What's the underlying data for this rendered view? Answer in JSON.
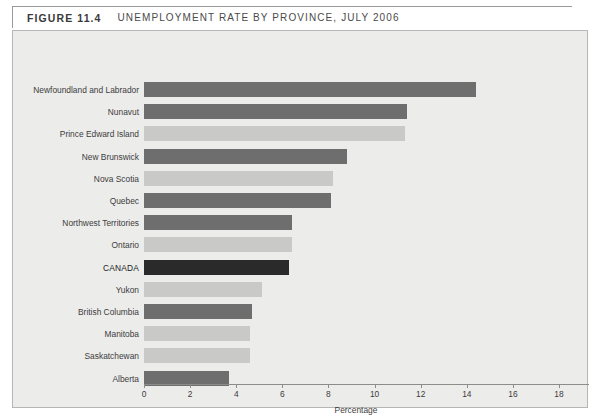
{
  "header": {
    "figure_number": "FIGURE 11.4",
    "caption": "UNEMPLOYMENT RATE BY PROVINCE, JULY 2006"
  },
  "colors": {
    "page_background": "#ffffff",
    "plot_background": "#ececeb",
    "plot_border": "#b6b6b4",
    "bar_dark": "#6e6e6e",
    "bar_light": "#c9c9c7",
    "bar_highlight": "#2a2a2a",
    "axis": "#8c8c8a",
    "text": "#3c3c3c"
  },
  "chart_data": {
    "type": "bar",
    "orientation": "horizontal",
    "title": "UNEMPLOYMENT RATE BY PROVINCE, JULY 2006",
    "xlabel": "Percentage",
    "ylabel": "",
    "xlim": [
      0,
      19.3
    ],
    "xticks": [
      0,
      2,
      4,
      6,
      8,
      10,
      12,
      14,
      16,
      18
    ],
    "xticklabels": [
      "0",
      "2",
      "4",
      "6",
      "8",
      "10",
      "12",
      "14",
      "16",
      "18"
    ],
    "grid": false,
    "legend": false,
    "categories": [
      "Newfoundland and Labrador",
      "Nunavut",
      "Prince Edward Island",
      "New Brunswick",
      "Nova Scotia",
      "Quebec",
      "Northwest Territories",
      "Ontario",
      "CANADA",
      "Yukon",
      "British Columbia",
      "Manitoba",
      "Saskatchewan",
      "Alberta"
    ],
    "values": [
      14.4,
      11.4,
      11.3,
      8.8,
      8.2,
      8.1,
      6.4,
      6.4,
      6.3,
      5.1,
      4.7,
      4.6,
      4.6,
      3.7
    ],
    "bar_styles": [
      "dark",
      "dark",
      "light",
      "dark",
      "light",
      "dark",
      "dark",
      "light",
      "highlight",
      "light",
      "dark",
      "light",
      "light",
      "dark"
    ]
  }
}
